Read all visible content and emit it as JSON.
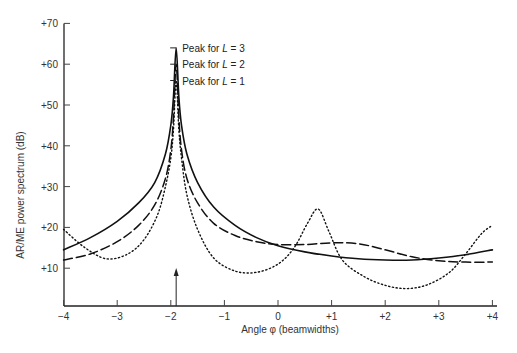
{
  "chart_data": {
    "type": "line",
    "title": "",
    "xlabel": "Angle φ (beamwidths)",
    "ylabel": "AR/ME power spectrum (dB)",
    "xlim": [
      -4,
      4
    ],
    "ylim": [
      0,
      70
    ],
    "x_ticks": [
      "−4",
      "−3",
      "−2",
      "−1",
      "0",
      "+1",
      "+2",
      "+3",
      "+4"
    ],
    "y_ticks": [
      "+10",
      "+20",
      "+30",
      "+40",
      "+50",
      "+60",
      "+70"
    ],
    "grid": false,
    "legend": "none (annotations only)",
    "annotations": [
      {
        "text": "Peak for L = 3",
        "x": -1.9,
        "y": 64
      },
      {
        "text": "Peak for L = 2",
        "x": -1.9,
        "y": 60
      },
      {
        "text": "Peak for L = 1",
        "x": -1.9,
        "y": 56
      },
      {
        "text": "source direction arrow",
        "x": -1.9,
        "y": 0
      }
    ],
    "series": [
      {
        "name": "L = 3 (solid)",
        "style": "solid",
        "x": [
          -4,
          -3.5,
          -3,
          -2.6,
          -2.3,
          -2.1,
          -2.0,
          -1.95,
          -1.9,
          -1.85,
          -1.8,
          -1.7,
          -1.5,
          -1.2,
          -0.8,
          -0.4,
          0,
          0.5,
          1,
          1.5,
          2,
          2.5,
          3,
          3.5,
          4
        ],
        "y": [
          14.5,
          17.5,
          21.5,
          26,
          31,
          38,
          45,
          52,
          64,
          52,
          45,
          38,
          31,
          25,
          20.5,
          17.5,
          15.5,
          14,
          13,
          12.3,
          12,
          12,
          12.5,
          13.3,
          14.5
        ]
      },
      {
        "name": "L = 2 (dashed)",
        "style": "dashed",
        "x": [
          -4,
          -3.5,
          -3,
          -2.6,
          -2.3,
          -2.1,
          -2.0,
          -1.95,
          -1.9,
          -1.85,
          -1.8,
          -1.7,
          -1.5,
          -1.2,
          -0.8,
          -0.4,
          0,
          0.5,
          1,
          1.5,
          2,
          2.5,
          3,
          3.5,
          4
        ],
        "y": [
          12,
          13.5,
          16.5,
          20.5,
          25.5,
          32,
          39,
          47,
          60,
          47,
          39,
          32,
          26,
          21,
          18,
          16.5,
          15.8,
          15.8,
          16.2,
          16,
          14.5,
          12.8,
          11.8,
          11.5,
          11.5
        ]
      },
      {
        "name": "L = 1 (dotted)",
        "style": "dotted",
        "x": [
          -4,
          -3.6,
          -3.2,
          -2.8,
          -2.5,
          -2.25,
          -2.1,
          -2.0,
          -1.95,
          -1.9,
          -1.85,
          -1.8,
          -1.7,
          -1.5,
          -1.2,
          -0.8,
          -0.4,
          0,
          0.3,
          0.55,
          0.75,
          0.95,
          1.2,
          1.6,
          2,
          2.4,
          2.8,
          3.2,
          3.5,
          3.8,
          4
        ],
        "y": [
          19.5,
          15,
          12.3,
          13.5,
          17,
          23,
          30,
          37,
          44,
          56,
          44,
          37,
          28,
          19.5,
          12.5,
          9.3,
          9,
          11,
          15,
          21,
          24.5,
          19,
          12,
          8,
          5.8,
          5,
          6,
          9,
          13.5,
          18.5,
          20.5
        ]
      }
    ]
  }
}
